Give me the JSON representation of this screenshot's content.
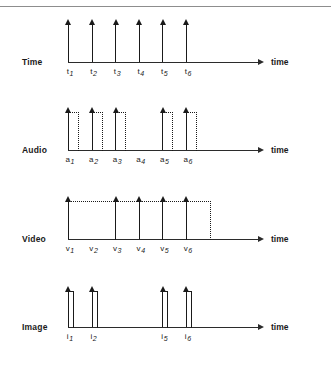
{
  "figure": {
    "axis_caption": "time",
    "slot_start_x": 68,
    "slot_spacing": 23.6,
    "axis_left": 68,
    "axis_right": 258,
    "rows": [
      {
        "name": "time",
        "label": "Time",
        "baseline_y": 62,
        "kind": "impulse",
        "pulse_height": 38,
        "slots": [
          {
            "label": "t",
            "sub": "1",
            "index": 1,
            "filled": true,
            "width_slots": 0
          },
          {
            "label": "t",
            "sub": "2",
            "index": 2,
            "filled": true,
            "width_slots": 0
          },
          {
            "label": "t",
            "sub": "3",
            "index": 3,
            "filled": true,
            "width_slots": 0
          },
          {
            "label": "t",
            "sub": "4",
            "index": 4,
            "filled": true,
            "width_slots": 0
          },
          {
            "label": "t",
            "sub": "5",
            "index": 5,
            "filled": true,
            "width_slots": 0
          },
          {
            "label": "t",
            "sub": "6",
            "index": 6,
            "filled": true,
            "width_slots": 0
          }
        ]
      },
      {
        "name": "audio",
        "label": "Audio",
        "baseline_y": 150,
        "kind": "dotted-pulse",
        "pulse_height": 38,
        "pulse_width": 10,
        "slots": [
          {
            "label": "a",
            "sub": "1",
            "index": 1,
            "filled": true,
            "width_slots": 0
          },
          {
            "label": "a",
            "sub": "2",
            "index": 2,
            "filled": true,
            "width_slots": 0
          },
          {
            "label": "a",
            "sub": "3",
            "index": 3,
            "filled": true,
            "width_slots": 0
          },
          {
            "label": "a",
            "sub": "4",
            "index": 4,
            "filled": false,
            "width_slots": 0
          },
          {
            "label": "a",
            "sub": "5",
            "index": 5,
            "filled": true,
            "width_slots": 0
          },
          {
            "label": "a",
            "sub": "6",
            "index": 6,
            "filled": true,
            "width_slots": 0
          }
        ]
      },
      {
        "name": "video",
        "label": "Video",
        "baseline_y": 239,
        "kind": "dotted-pulse",
        "pulse_height": 38,
        "slots": [
          {
            "label": "v",
            "sub": "1",
            "index": 1,
            "filled": true,
            "width_slots": 2
          },
          {
            "label": "v",
            "sub": "2",
            "index": 2,
            "filled": false,
            "width_slots": 0
          },
          {
            "label": "v",
            "sub": "3",
            "index": 3,
            "filled": true,
            "width_slots": 2
          },
          {
            "label": "v",
            "sub": "4",
            "index": 4,
            "filled": true,
            "width_slots": 1
          },
          {
            "label": "v",
            "sub": "5",
            "index": 5,
            "filled": true,
            "width_slots": 1
          },
          {
            "label": "v",
            "sub": "6",
            "index": 6,
            "filled": true,
            "width_slots": 1
          }
        ]
      },
      {
        "name": "image",
        "label": "Image",
        "baseline_y": 327,
        "kind": "solid-spike",
        "pulse_height": 36,
        "pulse_width": 5,
        "slots": [
          {
            "label": "i",
            "sub": "1",
            "index": 1,
            "filled": true,
            "width_slots": 0
          },
          {
            "label": "i",
            "sub": "2",
            "index": 2,
            "filled": true,
            "width_slots": 0
          },
          {
            "label": "",
            "sub": "",
            "index": 3,
            "filled": false,
            "width_slots": 0
          },
          {
            "label": "",
            "sub": "",
            "index": 4,
            "filled": false,
            "width_slots": 0
          },
          {
            "label": "i",
            "sub": "5",
            "index": 5,
            "filled": true,
            "width_slots": 0
          },
          {
            "label": "i",
            "sub": "6",
            "index": 6,
            "filled": true,
            "width_slots": 0
          }
        ]
      }
    ]
  }
}
